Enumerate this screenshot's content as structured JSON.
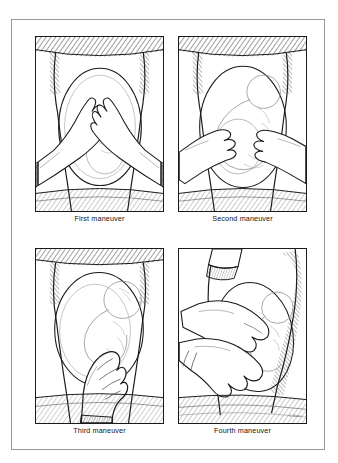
{
  "figure": {
    "frame_color": "#9a9a9a",
    "panel_border_color": "#1a1a1a",
    "background_color": "#ffffff",
    "ink_color": "#1a1a1a",
    "signature": "C. Bauer"
  },
  "panels": [
    {
      "id": "panel-1",
      "caption": "First maneuver",
      "description": "Examiner's two hands palpating the uterine fundus from above; patient supine on examination table.",
      "hands": 2,
      "hand_position": "fundus"
    },
    {
      "id": "panel-2",
      "caption": "Second maneuver",
      "description": "Examiner's hands palpating the lateral sides of the abdomen to locate the fetal back and small parts.",
      "hands": 2,
      "hand_position": "lateral-sides"
    },
    {
      "id": "panel-3",
      "caption": "Third maneuver",
      "description": "Single hand grasping the presenting part just above the symphysis pubis (Pawlik's grip).",
      "hands": 1,
      "hand_position": "suprapubic"
    },
    {
      "id": "panel-4",
      "caption": "Fourth maneuver",
      "description": "Examiner faces the patient's feet; both hands palpate downward toward the pelvic inlet to assess descent.",
      "hands": 2,
      "hand_position": "pelvic-inlet"
    }
  ]
}
